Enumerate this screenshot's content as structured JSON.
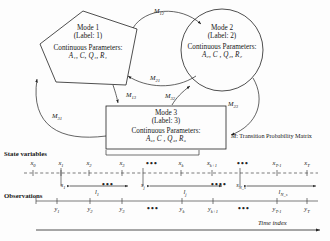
{
  "figure": {
    "legend": {
      "symbol": "M",
      "text": ": Transition Probability Matrix"
    }
  },
  "modes": [
    {
      "id": "mode-1",
      "shape": "pentagon",
      "title": "Mode 1",
      "label_line": "(Label: 1)",
      "params_heading": "Continuous Parameters:",
      "params_values": "A₁, C, Q₁, R₁"
    },
    {
      "id": "mode-2",
      "shape": "circle",
      "title": "Mode 2",
      "label_line": "(Label: 2)",
      "params_heading": "Continuous Parameters:",
      "params_values": "A₂, C , Q₂, R₂"
    },
    {
      "id": "mode-3",
      "shape": "rectangle",
      "title": "Mode 3",
      "label_line": "(Label: 3)",
      "params_heading": "Continuous Parameters:",
      "params_values": "A₃, C , Q₃, R₃"
    }
  ],
  "transitions": [
    {
      "name": "m12",
      "label": "M",
      "sub": "12"
    },
    {
      "name": "m21",
      "label": "M",
      "sub": "21"
    },
    {
      "name": "m13",
      "label": "M",
      "sub": "13"
    },
    {
      "name": "m31",
      "label": "M",
      "sub": "31"
    },
    {
      "name": "m32",
      "label": "M",
      "sub": "32"
    },
    {
      "name": "m23",
      "label": "M",
      "sub": "23"
    }
  ],
  "timeline": {
    "state_row_title": "State variables",
    "observation_row_title": "Observations",
    "time_axis_label": "Time index",
    "state_ticks": [
      {
        "base": "x",
        "sub": "0",
        "x": 33
      },
      {
        "base": "x",
        "sub": "1",
        "x": 61
      },
      {
        "base": "x",
        "sub": "2",
        "x": 89
      },
      {
        "base": "x",
        "sub": "3",
        "x": 122
      },
      {
        "base": "",
        "sub": "",
        "x": 152,
        "dots": true
      },
      {
        "base": "x",
        "sub": "k",
        "x": 181
      },
      {
        "base": "x",
        "sub": "k+1",
        "x": 212
      },
      {
        "base": "",
        "sub": "",
        "x": 243,
        "dots": true
      },
      {
        "base": "x",
        "sub": "T-1",
        "x": 277
      },
      {
        "base": "x",
        "sub": "T",
        "x": 307
      }
    ],
    "segment_ticks": [
      {
        "base": "s",
        "sub": "1",
        "x": 63
      },
      {
        "base": "",
        "sub": "",
        "x": 108,
        "dots": true
      },
      {
        "base": "s",
        "sub": "j",
        "x": 143
      },
      {
        "base": "",
        "sub": "",
        "x": 218,
        "dots": true
      },
      {
        "base": "s",
        "sub": "N_s",
        "x": 240
      }
    ],
    "segments": [
      {
        "base": "l",
        "sub": "1",
        "x": 97
      },
      {
        "base": "l",
        "sub": "j",
        "x": 185
      },
      {
        "base": "l",
        "sub": "N_s",
        "x": 283
      }
    ],
    "observation_ticks": [
      {
        "base": "y",
        "sub": "1",
        "x": 57
      },
      {
        "base": "y",
        "sub": "2",
        "x": 90
      },
      {
        "base": "y",
        "sub": "3",
        "x": 122
      },
      {
        "base": "",
        "sub": "",
        "x": 153,
        "dots": true
      },
      {
        "base": "y",
        "sub": "k",
        "x": 182
      },
      {
        "base": "y",
        "sub": "k+1",
        "x": 213
      },
      {
        "base": "",
        "sub": "",
        "x": 244,
        "dots": true
      },
      {
        "base": "y",
        "sub": "T-1",
        "x": 277
      },
      {
        "base": "y",
        "sub": "T",
        "x": 307
      }
    ]
  },
  "colors": {
    "stroke": "#222222",
    "text": "#161616",
    "background": "#fdfdfd"
  }
}
